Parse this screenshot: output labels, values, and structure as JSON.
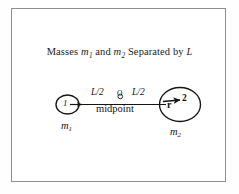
{
  "figure": {
    "title": {
      "prefix": "Masses ",
      "symbol_1": "m",
      "symbol_1_sub": "1",
      "conjunction": " and ",
      "symbol_2": "m",
      "symbol_2_sub": "2",
      "suffix": " Separated by ",
      "separation_symbol": "L"
    },
    "frame_color": "#8c8c92",
    "stroke_color": "#1a1a1a",
    "background_color": "#ffffff"
  },
  "diagram": {
    "type": "physics-free-body-separation",
    "left_body": {
      "number_label": "1",
      "mass_label": "m",
      "mass_sub": "1",
      "shape": "circle"
    },
    "right_body": {
      "number_label": "2",
      "mass_label": "m",
      "mass_sub": "2",
      "shape": "circle"
    },
    "midpoint": {
      "marker_label": "O",
      "caption": "midpoint"
    },
    "distances": {
      "left_segment": "L/2",
      "right_segment": "L/2",
      "total": "L"
    },
    "vector": {
      "label": "r",
      "direction": "right",
      "description": "position vector arrow pointing from midpoint toward mass 2"
    }
  }
}
